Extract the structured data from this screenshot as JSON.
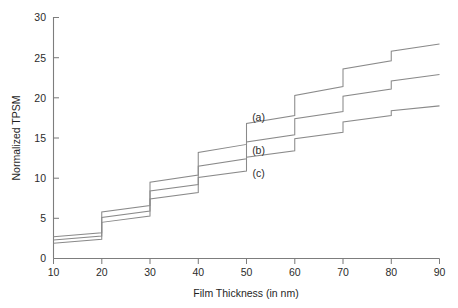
{
  "chart_data": {
    "type": "line",
    "title": "",
    "xlabel": "Film Thickness (in nm)",
    "ylabel": "Normalized TPSM",
    "xlim": [
      10,
      90
    ],
    "ylim": [
      0,
      30
    ],
    "xticks": [
      10,
      20,
      30,
      40,
      50,
      60,
      70,
      80,
      90
    ],
    "yticks": [
      0,
      5,
      10,
      15,
      20,
      25,
      30
    ],
    "grid": false,
    "legend_position": "inline-annotations",
    "annotations": [
      {
        "text": "(a)",
        "x": 52.5,
        "y": 17.1
      },
      {
        "text": "(b)",
        "x": 52.5,
        "y": 13.0
      },
      {
        "text": "(c)",
        "x": 52.5,
        "y": 10.1
      }
    ],
    "series": [
      {
        "name": "(a)",
        "label": "(a)",
        "x": [
          10,
          20,
          20,
          30,
          30,
          40,
          40,
          50,
          50,
          60,
          60,
          70,
          70,
          80,
          80,
          90
        ],
        "values": [
          2.7,
          3.2,
          5.8,
          6.6,
          9.5,
          10.4,
          13.2,
          14.2,
          16.8,
          17.8,
          20.3,
          21.4,
          23.6,
          24.6,
          25.8,
          26.7
        ]
      },
      {
        "name": "(b)",
        "label": "(b)",
        "x": [
          10,
          20,
          20,
          30,
          30,
          40,
          40,
          50,
          50,
          60,
          60,
          70,
          70,
          80,
          80,
          90
        ],
        "values": [
          2.3,
          2.8,
          5.1,
          5.9,
          8.4,
          9.2,
          11.5,
          12.4,
          14.5,
          15.4,
          17.4,
          18.3,
          20.2,
          21.1,
          22.1,
          22.9
        ]
      },
      {
        "name": "(c)",
        "label": "(c)",
        "x": [
          10,
          20,
          20,
          30,
          30,
          40,
          40,
          50,
          50,
          60,
          60,
          70,
          70,
          80,
          80,
          90
        ],
        "values": [
          1.9,
          2.4,
          4.5,
          5.3,
          7.4,
          8.2,
          10.1,
          10.9,
          12.6,
          13.4,
          14.9,
          15.7,
          17.0,
          17.8,
          18.4,
          19.0
        ]
      }
    ]
  },
  "labels": {
    "y0": "0",
    "y5": "5",
    "y10": "10",
    "y15": "15",
    "y20": "20",
    "y25": "25",
    "y30": "30",
    "x10": "10",
    "x20": "20",
    "x30": "30",
    "x40": "40",
    "x50": "50",
    "x60": "60",
    "x70": "70",
    "x80": "80",
    "x90": "90",
    "xaxis_title": "Film Thickness (in nm)",
    "yaxis_title": "Normalized TPSM",
    "series_a": "(a)",
    "series_b": "(b)",
    "series_c": "(c)"
  },
  "colors": {
    "line": "#8a8a8a",
    "axis": "#7d7d7d",
    "text": "#2b2b2b",
    "background": "#ffffff"
  }
}
